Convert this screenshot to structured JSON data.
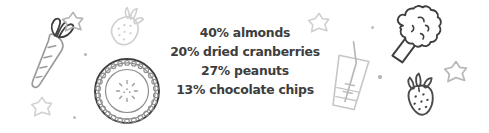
{
  "canvas": {
    "width": 489,
    "height": 133,
    "background": "#ffffff"
  },
  "colors": {
    "text": "#3d3d3d",
    "ink_dark": "#3a3a3a",
    "ink_mid": "#8a8a8a",
    "ink_light": "#c9c9c9",
    "dot": "#b5b5b5"
  },
  "recipe": {
    "title": "trail mix recipe proportions",
    "lines": [
      {
        "percent": "40%",
        "ingredient": "almonds",
        "text": "40% almonds"
      },
      {
        "percent": "20%",
        "ingredient": "dried cranberries",
        "text": "20% dried cranberries"
      },
      {
        "percent": "27%",
        "ingredient": "peanuts",
        "text": "27% peanuts"
      },
      {
        "percent": "13%",
        "ingredient": "chocolate chips",
        "text": "13% chocolate chips"
      }
    ]
  },
  "decorations": {
    "carrot": {
      "name": "carrot-icon",
      "tone": "mid"
    },
    "strawberry_light": {
      "name": "strawberry-icon",
      "tone": "light"
    },
    "cookie": {
      "name": "cookie-icon",
      "tone": "dark"
    },
    "star_top_left": {
      "name": "star-icon",
      "tone": "mid"
    },
    "star_bottom_left": {
      "name": "star-icon",
      "tone": "light"
    },
    "star_center_right": {
      "name": "star-icon",
      "tone": "light"
    },
    "star_far_right": {
      "name": "star-icon",
      "tone": "mid"
    },
    "glass": {
      "name": "drinking-glass-icon",
      "tone": "light"
    },
    "broccoli": {
      "name": "broccoli-icon",
      "tone": "dark"
    },
    "strawberry_dark": {
      "name": "strawberry-icon",
      "tone": "dark"
    }
  }
}
